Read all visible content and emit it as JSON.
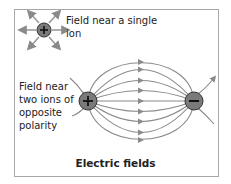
{
  "labels": {
    "single_ion": "Field near a single ion",
    "two_ions": "Field near two ions of opposite polarity",
    "caption": "Electric fields"
  },
  "ions": {
    "single": {
      "sign": "+",
      "color": "#7a7a7a"
    },
    "positive": {
      "sign": "+",
      "color": "#7a7a7a"
    },
    "negative": {
      "sign": "−",
      "color": "#7a7a7a"
    }
  },
  "colors": {
    "field_line": "#8a8a8a",
    "frame": "#a8a8a8",
    "text": "#222222"
  }
}
